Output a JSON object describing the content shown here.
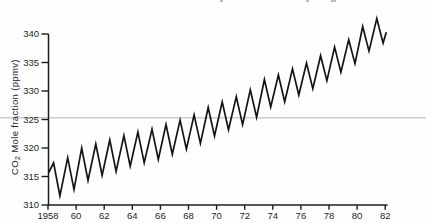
{
  "figure": {
    "background": "#fefefe",
    "y_axis_title": {
      "prefix": "CO",
      "sub": "2",
      "rest": " Mole fraction (ppmv)"
    },
    "colors": {
      "curve": "#141414",
      "axis": "#1c1c1c",
      "tick_label": "#1f1f1f",
      "artifact_line": "#cdcdcd"
    }
  },
  "chart_data": {
    "type": "line",
    "title": "",
    "xlabel": "",
    "ylabel": "CO2 Mole fraction (ppmv)",
    "xlim": [
      1958,
      1982.3
    ],
    "ylim": [
      310,
      340
    ],
    "grid": false,
    "legend": false,
    "y_ticks": [
      310,
      315,
      320,
      325,
      330,
      335,
      340
    ],
    "x_ticks": [
      1958,
      1960,
      1962,
      1964,
      1966,
      1968,
      1970,
      1972,
      1974,
      1976,
      1978,
      1980,
      1982
    ],
    "x_tick_labels": [
      "1958",
      "60",
      "62",
      "64",
      "66",
      "68",
      "70",
      "72",
      "74",
      "76",
      "78",
      "80",
      "82"
    ],
    "artifact_line_value": 325.3,
    "series": [
      {
        "name": "CO2 mole fraction (seasonal sawtooth)",
        "color": "#141414",
        "points": [
          [
            1958.05,
            315.7
          ],
          [
            1958.4,
            317.4
          ],
          [
            1958.85,
            311.6
          ],
          [
            1959.4,
            318.3
          ],
          [
            1959.85,
            312.7
          ],
          [
            1960.4,
            320.0
          ],
          [
            1960.85,
            314.3
          ],
          [
            1961.4,
            320.7
          ],
          [
            1961.85,
            315.2
          ],
          [
            1962.4,
            321.4
          ],
          [
            1962.85,
            315.9
          ],
          [
            1963.4,
            322.2
          ],
          [
            1963.85,
            316.8
          ],
          [
            1964.4,
            322.8
          ],
          [
            1964.85,
            317.4
          ],
          [
            1965.4,
            323.3
          ],
          [
            1965.85,
            318.0
          ],
          [
            1966.4,
            324.1
          ],
          [
            1966.85,
            318.9
          ],
          [
            1967.4,
            324.9
          ],
          [
            1967.85,
            319.8
          ],
          [
            1968.4,
            325.8
          ],
          [
            1968.85,
            320.8
          ],
          [
            1969.4,
            327.1
          ],
          [
            1969.85,
            322.1
          ],
          [
            1970.4,
            328.1
          ],
          [
            1970.85,
            323.2
          ],
          [
            1971.4,
            329.0
          ],
          [
            1971.85,
            324.1
          ],
          [
            1972.4,
            330.2
          ],
          [
            1972.85,
            325.4
          ],
          [
            1973.4,
            332.0
          ],
          [
            1973.85,
            327.2
          ],
          [
            1974.4,
            332.8
          ],
          [
            1974.85,
            328.1
          ],
          [
            1975.4,
            333.9
          ],
          [
            1975.85,
            329.3
          ],
          [
            1976.4,
            334.9
          ],
          [
            1976.85,
            330.4
          ],
          [
            1977.4,
            336.2
          ],
          [
            1977.85,
            331.8
          ],
          [
            1978.4,
            337.7
          ],
          [
            1978.85,
            333.3
          ],
          [
            1979.4,
            339.0
          ],
          [
            1979.85,
            334.8
          ],
          [
            1980.4,
            341.3
          ],
          [
            1980.85,
            337.0
          ],
          [
            1981.4,
            342.7
          ],
          [
            1981.85,
            338.4
          ],
          [
            1982.08,
            340.3
          ]
        ]
      }
    ]
  }
}
